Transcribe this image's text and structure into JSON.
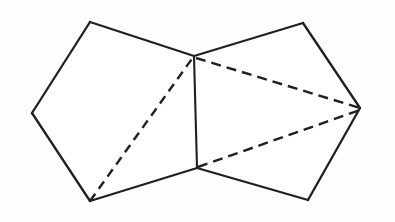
{
  "figure": {
    "type": "line-diagram",
    "background_color": "#fefefe",
    "stroke_color": "#231f20",
    "canvas": {
      "width": 395,
      "height": 222
    },
    "vertices": {
      "top_left": {
        "label": "top-left",
        "x": 90,
        "y": 22
      },
      "left": {
        "label": "left",
        "x": 32,
        "y": 113
      },
      "bottom_left": {
        "label": "bottom-left",
        "x": 90,
        "y": 201
      },
      "center_bottom": {
        "label": "center-bottom",
        "x": 197,
        "y": 168
      },
      "center_top": {
        "label": "center-top",
        "x": 194,
        "y": 56
      },
      "top_right": {
        "label": "top-right",
        "x": 303,
        "y": 23
      },
      "right": {
        "label": "right",
        "x": 360,
        "y": 108
      },
      "bottom_right": {
        "label": "bottom-right",
        "x": 308,
        "y": 200
      }
    },
    "left_polygon": {
      "name": "left-pentagon",
      "points": "90,22 32,113 90,201 197,168 194,56"
    },
    "right_polygon": {
      "name": "right-pentagon",
      "points": "194,56 303,23 360,108 308,200 197,168"
    },
    "solid_edges": [
      {
        "name": "edge-top-left-to-left",
        "d": "M 90,22 L 32,113"
      },
      {
        "name": "edge-left-to-bottom-left",
        "d": "M 32,113 L 90,201"
      },
      {
        "name": "edge-bottom-left-to-center-bottom",
        "d": "M 90,201 L 197,168"
      },
      {
        "name": "edge-center-top-to-top-left",
        "d": "M 194,56 L 90,22"
      },
      {
        "name": "edge-shared-center",
        "d": "M 194,56 L 197,168"
      },
      {
        "name": "edge-center-top-to-top-right",
        "d": "M 194,56 L 303,23"
      },
      {
        "name": "edge-top-right-to-right",
        "d": "M 303,23 L 360,108"
      },
      {
        "name": "edge-right-to-bottom-right",
        "d": "M 360,108 L 308,200"
      },
      {
        "name": "edge-bottom-right-to-center-bottom",
        "d": "M 308,200 L 197,168"
      }
    ],
    "dashed_edges": [
      {
        "name": "diagonal-bottom-left-to-center-top",
        "d": "M 90,201 L 194,56",
        "dash": "9 6"
      },
      {
        "name": "diagonal-center-top-to-right",
        "d": "M 196,58 L 360,108",
        "dash": "10 6"
      },
      {
        "name": "diagonal-center-bottom-to-right",
        "d": "M 198,167 L 360,110",
        "dash": "10 6"
      }
    ]
  }
}
